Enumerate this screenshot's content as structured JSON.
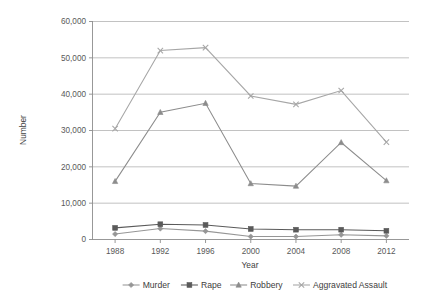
{
  "chart_data": {
    "type": "line",
    "title": "",
    "xlabel": "Year",
    "ylabel": "Number",
    "categories": [
      "1988",
      "1992",
      "1996",
      "2000",
      "2004",
      "2008",
      "2012"
    ],
    "x": [
      1988,
      1992,
      1996,
      2000,
      2004,
      2008,
      2012
    ],
    "ylim": [
      0,
      60000
    ],
    "yticks": [
      0,
      10000,
      20000,
      30000,
      40000,
      50000,
      60000
    ],
    "ytick_labels": [
      "0",
      "10,000",
      "20,000",
      "30,000",
      "40,000",
      "50,000",
      "60,000"
    ],
    "grid": "horizontal",
    "legend_position": "bottom",
    "series": [
      {
        "name": "Murder",
        "marker": "diamond",
        "color": "#969696",
        "values": [
          1500,
          3000,
          2300,
          800,
          800,
          1300,
          1000
        ]
      },
      {
        "name": "Rape",
        "marker": "square",
        "color": "#5a5a5a",
        "values": [
          3200,
          4200,
          4000,
          2900,
          2700,
          2700,
          2400
        ]
      },
      {
        "name": "Robbery",
        "marker": "triangle",
        "color": "#8c8c8c",
        "values": [
          16000,
          35000,
          37500,
          15400,
          14700,
          26700,
          16200
        ]
      },
      {
        "name": "Aggravated Assault",
        "marker": "cross",
        "color": "#a6a6a6",
        "values": [
          30500,
          52000,
          52800,
          39500,
          37200,
          41000,
          26800
        ]
      }
    ]
  },
  "axes": {
    "y_title": "Number",
    "x_title": "Year"
  },
  "legend": {
    "items": [
      {
        "label": "Murder"
      },
      {
        "label": "Rape"
      },
      {
        "label": "Robbery"
      },
      {
        "label": "Aggravated Assault"
      }
    ]
  },
  "colors": {
    "gridline": "#b3b3b3",
    "axis": "#8c8c8c",
    "text": "#404040",
    "background": "#ffffff"
  }
}
